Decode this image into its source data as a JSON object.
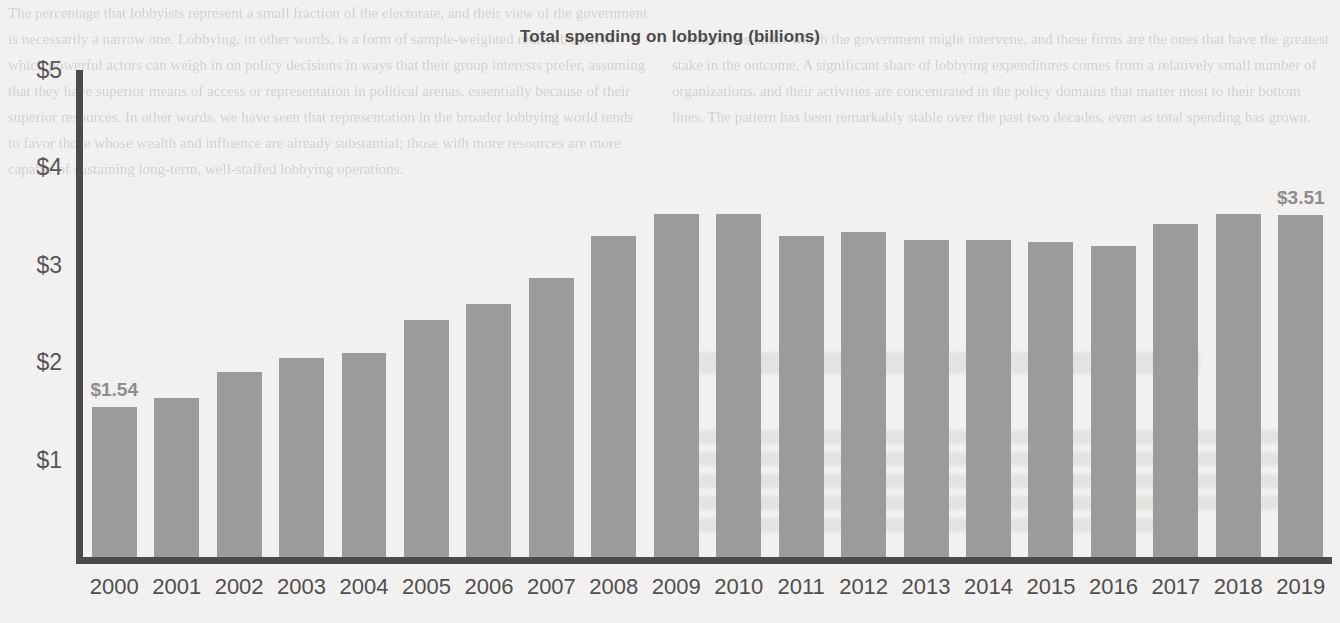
{
  "chart_data": {
    "type": "bar",
    "title": "Total spending on lobbying (billions)",
    "xlabel": "",
    "ylabel": "",
    "ylim": [
      0,
      5
    ],
    "ytick_labels": [
      "$5",
      "$4",
      "$3",
      "$2",
      "$1"
    ],
    "yticks": [
      5,
      4,
      3,
      2,
      1
    ],
    "grid": false,
    "legend": "none",
    "bar_color": "#9b9b9b",
    "axis_color": "#4b4b4b",
    "categories": [
      "2000",
      "2001",
      "2002",
      "2003",
      "2004",
      "2005",
      "2006",
      "2007",
      "2008",
      "2009",
      "2010",
      "2011",
      "2012",
      "2013",
      "2014",
      "2015",
      "2016",
      "2017",
      "2018",
      "2019"
    ],
    "values": [
      1.54,
      1.63,
      1.9,
      2.04,
      2.09,
      2.43,
      2.6,
      2.86,
      3.3,
      3.52,
      3.52,
      3.3,
      3.34,
      3.25,
      3.25,
      3.23,
      3.19,
      3.42,
      3.52,
      3.51
    ],
    "annotations": [
      {
        "category": "2000",
        "label": "$1.54"
      },
      {
        "category": "2019",
        "label": "$3.51"
      }
    ]
  },
  "background": {
    "left_column_text": "The percentage that lobbyists represent a small fraction of the electorate, and their view of the government is necessarily a narrow one. Lobbying, in other words, is a form of sample-weighted redistribution in which powerful actors can weigh in on policy decisions in ways that their group interests prefer, assuming that they have superior means of access or representation in political arenas, essentially because of their superior resources. In other words, we have seen that representation in the broader lobbying world tends to favor those whose wealth and influence are already substantial; those with more resources are more capable of sustaining long-term, well-staffed lobbying operations.",
    "right_column_text": "conditions under which the government might intervene, and these firms are the ones that have the greatest stake in the outcome. A significant share of lobbying expenditures comes from a relatively small number of organizations, and their activities are concentrated in the policy domains that matter most to their bottom lines. The pattern has been remarkably stable over the past two decades, even as total spending has grown.",
    "right_heading": "The growth of lobbying"
  }
}
